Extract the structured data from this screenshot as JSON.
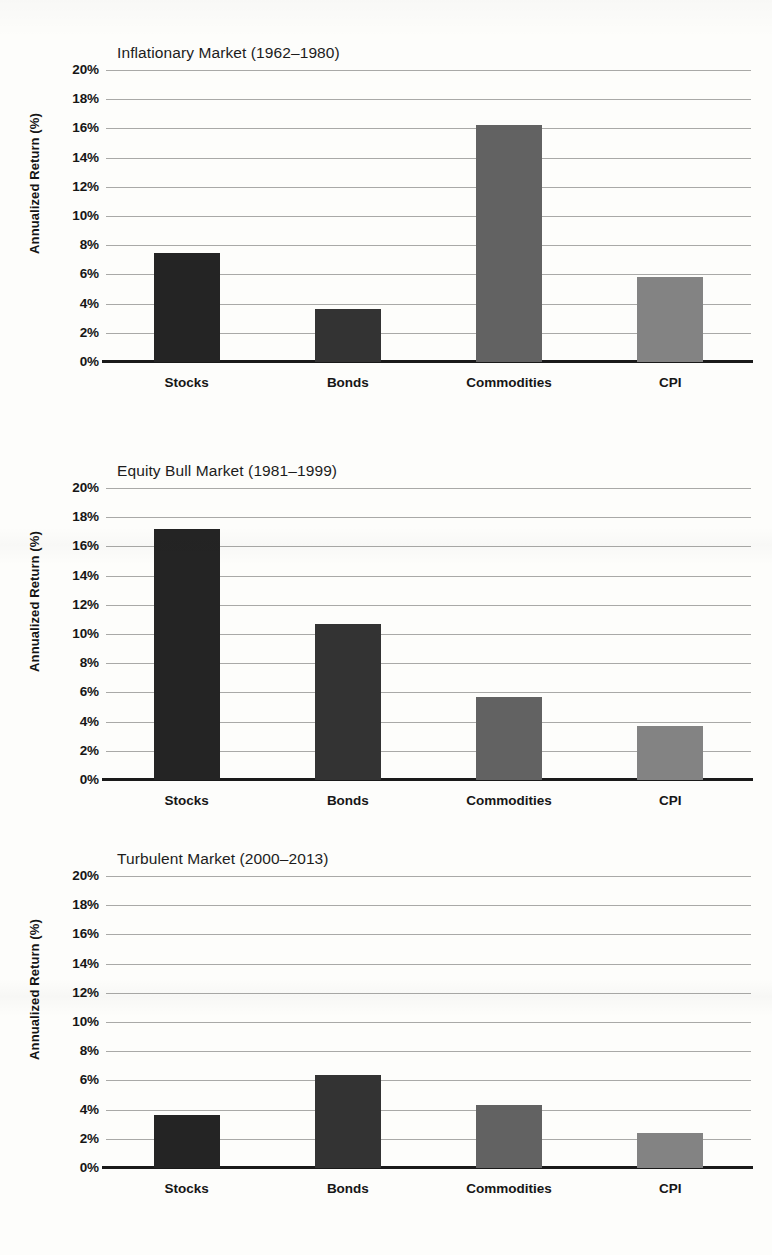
{
  "figure": {
    "axis_ticks": [
      "0%",
      "2%",
      "4%",
      "6%",
      "8%",
      "10%",
      "12%",
      "14%",
      "16%",
      "18%",
      "20%"
    ],
    "ylabel": "Annualized Return (%)",
    "categories": [
      "Stocks",
      "Bonds",
      "Commodities",
      "CPI"
    ],
    "series_colors": [
      "#242424",
      "#333333",
      "#626262",
      "#838383"
    ]
  },
  "chart_data": [
    {
      "type": "bar",
      "title": "Inflationary Market (1962–1980)",
      "xlabel": "",
      "ylabel": "Annualized Return (%)",
      "categories": [
        "Stocks",
        "Bonds",
        "Commodities",
        "CPI"
      ],
      "values": [
        7.5,
        3.6,
        16.2,
        5.8
      ],
      "colors": [
        "#242424",
        "#333333",
        "#626262",
        "#838383"
      ],
      "ylim": [
        0,
        20
      ],
      "ytick_step": 2,
      "grid": true,
      "legend": null
    },
    {
      "type": "bar",
      "title": "Equity Bull Market (1981–1999)",
      "xlabel": "",
      "ylabel": "Annualized Return (%)",
      "categories": [
        "Stocks",
        "Bonds",
        "Commodities",
        "CPI"
      ],
      "values": [
        17.2,
        10.7,
        5.7,
        3.7
      ],
      "colors": [
        "#242424",
        "#333333",
        "#626262",
        "#838383"
      ],
      "ylim": [
        0,
        20
      ],
      "ytick_step": 2,
      "grid": true,
      "legend": null
    },
    {
      "type": "bar",
      "title": "Turbulent Market (2000–2013)",
      "xlabel": "",
      "ylabel": "Annualized Return (%)",
      "categories": [
        "Stocks",
        "Bonds",
        "Commodities",
        "CPI"
      ],
      "values": [
        3.6,
        6.4,
        4.3,
        2.4
      ],
      "colors": [
        "#242424",
        "#333333",
        "#626262",
        "#838383"
      ],
      "ylim": [
        0,
        20
      ],
      "ytick_step": 2,
      "grid": true,
      "legend": null
    }
  ]
}
